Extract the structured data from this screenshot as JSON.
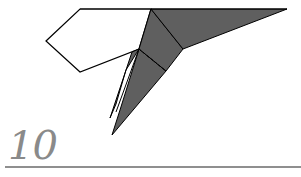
{
  "step": {
    "number": "10"
  },
  "colors": {
    "paper_white": "#ffffff",
    "paper_dark": "#5f5f5f",
    "outline": "#000000",
    "step_gray": "#8a8a8a",
    "rule_gray": "#8f8f8f"
  },
  "diagram": {
    "elements": [
      "white-pentagon-flap",
      "dark-top-wing",
      "dark-center-panel",
      "dark-lower-blade",
      "dark-back-blade",
      "valley-fold-dashed-line"
    ]
  }
}
